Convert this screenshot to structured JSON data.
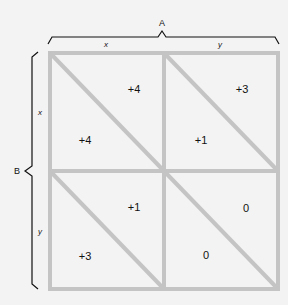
{
  "diagram": {
    "type": "payoff-matrix",
    "player_a": {
      "label": "A",
      "strategies": [
        "x",
        "y"
      ]
    },
    "player_b": {
      "label": "B",
      "strategies": [
        "x",
        "y"
      ]
    },
    "cells": [
      {
        "row": "x",
        "col": "x",
        "payoff_a": "+4",
        "payoff_b": "+4"
      },
      {
        "row": "x",
        "col": "y",
        "payoff_a": "+3",
        "payoff_b": "+1"
      },
      {
        "row": "y",
        "col": "x",
        "payoff_a": "+1",
        "payoff_b": "+3"
      },
      {
        "row": "y",
        "col": "y",
        "payoff_a": "0",
        "payoff_b": "0"
      }
    ],
    "colors": {
      "grid": "#c4c4c4",
      "background": "#f3f3f3",
      "brace": "#111111"
    }
  }
}
